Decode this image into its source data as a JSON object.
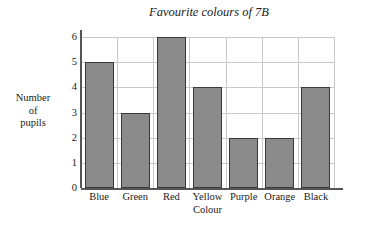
{
  "chart_data": {
    "type": "bar",
    "title": "Favourite colours of 7B",
    "xlabel": "Colour",
    "ylabel": "Number of pupils",
    "ylabel_lines": [
      "Number",
      "of",
      "pupils"
    ],
    "categories": [
      "Blue",
      "Green",
      "Red",
      "Yellow",
      "Purple",
      "Orange",
      "Black"
    ],
    "values": [
      5,
      3,
      6,
      4,
      2,
      2,
      4
    ],
    "ylim": [
      0,
      6
    ],
    "ytick_labels": [
      "0",
      "1",
      "2",
      "3",
      "4",
      "5",
      "6"
    ],
    "ytick_values": [
      0,
      1,
      2,
      3,
      4,
      5,
      6
    ],
    "grid": true,
    "legend": "none",
    "bar_fill_color": "#8a8a8a",
    "bar_edge_color": "#3a3a3a",
    "gridline_color": "#c9c9c9",
    "axis_color": "#555555",
    "background_color": "#ffffff"
  }
}
